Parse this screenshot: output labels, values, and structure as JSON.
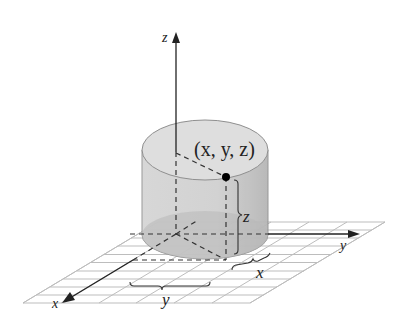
{
  "figure": {
    "type": "3D cylindrical coordinate illustration",
    "axes": {
      "x_label": "x",
      "y_label": "y",
      "z_label": "z"
    },
    "point_label": "(x, y, z)",
    "brace_labels": {
      "height": "z",
      "x_distance": "x",
      "y_distance": "y"
    },
    "colors": {
      "cylinder_side": "#c9c9c9",
      "cylinder_top": "#dcdcdc",
      "cylinder_base": "#b5b5b5",
      "grid": "#b8b8b8",
      "axis": "#222222",
      "point": "#000000"
    }
  }
}
